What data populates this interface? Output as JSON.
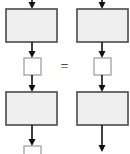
{
  "diagram": {
    "type": "flowchart-equivalence",
    "canvas": {
      "width": 130,
      "height": 154,
      "background": "#ffffff"
    },
    "operator": {
      "symbol": "=",
      "name": "equals-operator",
      "x": 64.5,
      "y": 67
    },
    "style": {
      "box_fill": "#efefef",
      "box_stroke": "#4a4a4a",
      "box_stroke_width": 1.6,
      "square_fill": "#ffffff",
      "square_stroke": "#9a9a9a",
      "square_stroke_width": 1.2,
      "arrow_color": "#111111",
      "arrow_line_width": 1.6,
      "arrow_head_width": 7,
      "arrow_head_height": 7
    },
    "columns": [
      {
        "name": "left-column",
        "center_x": 32,
        "nodes": [
          {
            "kind": "arrow",
            "name": "arrow-in-top",
            "x1": 32,
            "y1": 0,
            "x2": 32,
            "y2": 9
          },
          {
            "kind": "rect",
            "name": "process-block-1",
            "x": 6,
            "y": 9,
            "w": 51,
            "h": 33
          },
          {
            "kind": "arrow",
            "name": "arrow-block1-to-square",
            "x1": 32,
            "y1": 42,
            "x2": 32,
            "y2": 58
          },
          {
            "kind": "square",
            "name": "state-square-1",
            "x": 24,
            "y": 58,
            "w": 17,
            "h": 17
          },
          {
            "kind": "arrow",
            "name": "arrow-square-to-block2",
            "x1": 32,
            "y1": 75,
            "x2": 32,
            "y2": 92
          },
          {
            "kind": "rect",
            "name": "process-block-2",
            "x": 6,
            "y": 92,
            "w": 51,
            "h": 33
          },
          {
            "kind": "arrow",
            "name": "arrow-block2-to-square2",
            "x1": 32,
            "y1": 125,
            "x2": 32,
            "y2": 146
          },
          {
            "kind": "square",
            "name": "state-square-2-clipped",
            "x": 24,
            "y": 146,
            "w": 17,
            "h": 17
          }
        ]
      },
      {
        "name": "right-column",
        "center_x": 102,
        "nodes": [
          {
            "kind": "arrow",
            "name": "arrow-in-top",
            "x1": 102,
            "y1": 0,
            "x2": 102,
            "y2": 9
          },
          {
            "kind": "rect",
            "name": "process-block-1",
            "x": 77,
            "y": 9,
            "w": 51,
            "h": 33
          },
          {
            "kind": "arrow",
            "name": "arrow-block1-to-square",
            "x1": 102,
            "y1": 42,
            "x2": 102,
            "y2": 58
          },
          {
            "kind": "square",
            "name": "state-square-1",
            "x": 94,
            "y": 58,
            "w": 17,
            "h": 17
          },
          {
            "kind": "arrow",
            "name": "arrow-square-to-block2",
            "x1": 102,
            "y1": 75,
            "x2": 102,
            "y2": 92
          },
          {
            "kind": "rect",
            "name": "process-block-2",
            "x": 77,
            "y": 92,
            "w": 51,
            "h": 33
          },
          {
            "kind": "arrow",
            "name": "arrow-block2-out",
            "x1": 102,
            "y1": 125,
            "x2": 102,
            "y2": 152
          }
        ]
      }
    ]
  }
}
